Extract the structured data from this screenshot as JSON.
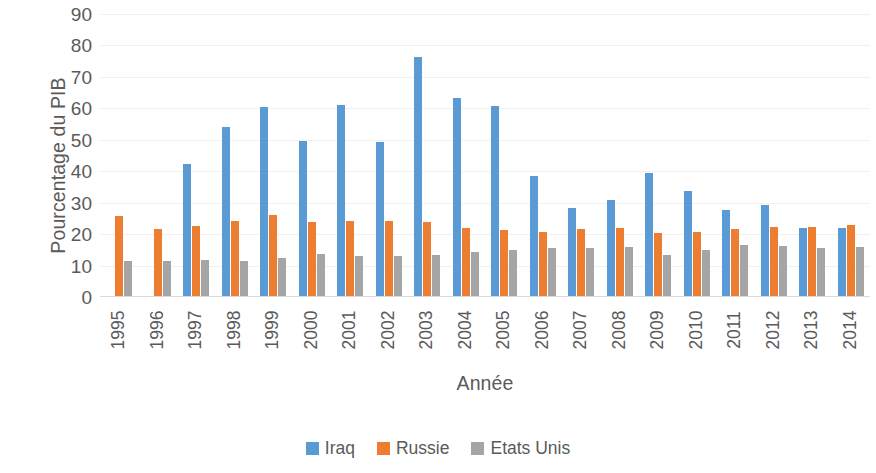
{
  "chart_data": {
    "type": "bar",
    "title": "",
    "xlabel": "Année",
    "ylabel": "Pourcentage du PIB",
    "ylim": [
      0,
      90
    ],
    "yticks": [
      0,
      10,
      20,
      30,
      40,
      50,
      60,
      70,
      80,
      90
    ],
    "grid": true,
    "legend_position": "bottom",
    "categories": [
      "1995",
      "1996",
      "1997",
      "1998",
      "1999",
      "2000",
      "2001",
      "2002",
      "2003",
      "2004",
      "2005",
      "2006",
      "2007",
      "2008",
      "2009",
      "2010",
      "2011",
      "2012",
      "2013",
      "2014"
    ],
    "series": [
      {
        "name": "Iraq",
        "color": "#5B9BD5",
        "values": [
          null,
          null,
          42.3,
          54.2,
          60.3,
          49.6,
          61.0,
          49.2,
          76.4,
          63.3,
          60.8,
          38.5,
          28.2,
          30.8,
          39.3,
          33.8,
          27.6,
          29.2,
          22.0,
          21.8
        ]
      },
      {
        "name": "Russie",
        "color": "#ED7D31",
        "values": [
          25.7,
          21.6,
          22.5,
          24.3,
          26.0,
          23.9,
          24.2,
          24.3,
          23.8,
          22.1,
          21.4,
          20.7,
          21.5,
          22.0,
          20.5,
          20.8,
          21.7,
          22.4,
          22.3,
          22.8
        ]
      },
      {
        "name": "Etats Unis",
        "color": "#A5A5A5",
        "values": [
          11.4,
          11.6,
          11.8,
          11.6,
          12.5,
          13.8,
          13.0,
          13.0,
          13.3,
          14.2,
          15.0,
          15.6,
          15.7,
          16.0,
          13.5,
          15.1,
          16.7,
          16.3,
          15.6,
          15.8
        ]
      }
    ]
  },
  "axis": {
    "y_title": "Pourcentage du PIB",
    "x_title": "Année"
  },
  "legend": {
    "items": [
      {
        "label": "Iraq",
        "color": "#5B9BD5"
      },
      {
        "label": "Russie",
        "color": "#ED7D31"
      },
      {
        "label": "Etats Unis",
        "color": "#A5A5A5"
      }
    ]
  }
}
